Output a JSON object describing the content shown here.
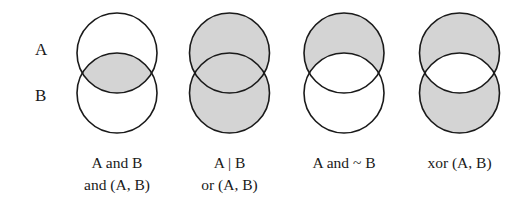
{
  "row_labels": {
    "top": "A",
    "bottom": "B"
  },
  "colors": {
    "fill": "#d4d4d4",
    "stroke": "#1a1a1a",
    "background": "#ffffff"
  },
  "diagrams": [
    {
      "id": "and",
      "shaded_regions": [
        "A∩B"
      ],
      "caption": [
        "A and B",
        "and (A, B)"
      ]
    },
    {
      "id": "or",
      "shaded_regions": [
        "A only",
        "A∩B",
        "B only"
      ],
      "caption": [
        "A | B",
        "or (A, B)"
      ]
    },
    {
      "id": "and-not",
      "shaded_regions": [
        "A only"
      ],
      "caption": [
        "A and ~ B",
        ""
      ]
    },
    {
      "id": "xor",
      "shaded_regions": [
        "A only",
        "B only"
      ],
      "caption": [
        "xor (A, B)",
        ""
      ]
    }
  ]
}
